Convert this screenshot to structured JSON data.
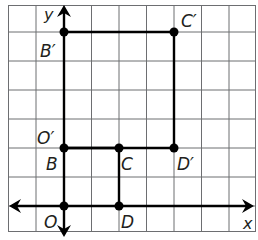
{
  "diagram": {
    "type": "coordinate-grid-dilation",
    "grid": {
      "columns": 9,
      "rows": 8,
      "line_color": "#6d6e71",
      "figure_color": "#000000"
    },
    "axes": {
      "x_label": "x",
      "y_label": "y"
    },
    "points": [
      {
        "name": "O",
        "label": "O",
        "coord": [
          0,
          0
        ]
      },
      {
        "name": "D",
        "label": "D",
        "coord": [
          2,
          0
        ]
      },
      {
        "name": "B",
        "label": "B",
        "coord": [
          0,
          2
        ]
      },
      {
        "name": "C",
        "label": "C",
        "coord": [
          2,
          2
        ]
      },
      {
        "name": "O'",
        "label": "O′",
        "coord": [
          0,
          2
        ]
      },
      {
        "name": "D'",
        "label": "D′",
        "coord": [
          4,
          2
        ]
      },
      {
        "name": "C'",
        "label": "C′",
        "coord": [
          4,
          6
        ]
      },
      {
        "name": "B'",
        "label": "B′",
        "coord": [
          0,
          6
        ]
      }
    ],
    "figures": [
      {
        "name": "OBCD",
        "vertices": [
          "O",
          "B",
          "C",
          "D"
        ]
      },
      {
        "name": "O'B'C'D'",
        "vertices": [
          "O'",
          "B'",
          "C'",
          "D'"
        ]
      }
    ]
  }
}
